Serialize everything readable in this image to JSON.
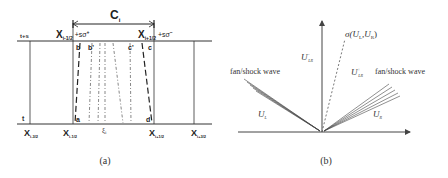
{
  "panel_a": {
    "caption": "(a)",
    "bracket_label": "C",
    "bracket_sub": "i",
    "time_top": "t+s",
    "time_bottom": "t",
    "top_left_x": "X",
    "top_left_sub": "i-1/2",
    "top_left_suffix": "+sσ",
    "top_left_sup": "+",
    "top_right_x": "X",
    "top_right_sub": "i+1/2",
    "top_right_suffix": "+sσ",
    "top_right_sup": "−",
    "points": {
      "a": "a",
      "b": "b",
      "b_prime": "b'",
      "c": "c",
      "c_prime": "c'",
      "d": "d"
    },
    "bottom_labels": [
      {
        "x": "X",
        "sub": "i-3/2"
      },
      {
        "x": "X",
        "sub": "i-1/2"
      },
      {
        "x": "ξ",
        "sub": "i"
      },
      {
        "x": "X",
        "sub": "i+1/2"
      },
      {
        "x": "X",
        "sub": "i+3/2"
      }
    ]
  },
  "panel_b": {
    "caption": "(b)",
    "sigma_label": "σ(U",
    "sigma_sub_l": "L",
    "sigma_mid": ",U",
    "sigma_sub_r": "R",
    "sigma_end": ")",
    "u_lr_minus": "U",
    "u_lr_minus_sup": "−",
    "u_lr_minus_sub": "LR",
    "u_lr_plus": "U",
    "u_lr_plus_sup": "+",
    "u_lr_plus_sub": "LR",
    "fan_left": "fan/shock wave",
    "fan_right": "fan/shock wave",
    "u_l": "U",
    "u_l_sub": "L",
    "u_r": "U",
    "u_r_sub": "R"
  }
}
